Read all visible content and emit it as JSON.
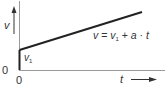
{
  "diagram": {
    "type": "velocity-time graph",
    "y_axis": {
      "label": "v",
      "origin_label": "0"
    },
    "x_axis": {
      "label": "t",
      "origin_label": "0"
    },
    "initial_value_label": {
      "main": "v",
      "sub": "1"
    },
    "formula": {
      "lhs": "v",
      "eq": "=",
      "term1_main": "v",
      "term1_sub": "1",
      "plus": "+",
      "term2": "a",
      "dot": "·",
      "term3": "t"
    },
    "colors": {
      "axis": "#8a8a8a",
      "line": "#222222",
      "text": "#333333"
    }
  }
}
